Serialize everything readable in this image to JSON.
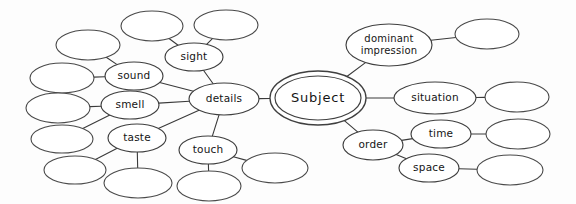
{
  "diagram": {
    "type": "mind-map",
    "background_color": "#fdfdfd",
    "stroke_color": "#3f3f3f",
    "text_color": "#151515",
    "width": 576,
    "height": 204
  },
  "nodes": [
    {
      "id": "subject",
      "label": "Subject",
      "cx": 318,
      "cy": 98,
      "rx": 43,
      "ry": 22,
      "shape": "double-ellipse",
      "style": "root",
      "empty": false
    },
    {
      "id": "details",
      "label": "details",
      "cx": 224,
      "cy": 99,
      "rx": 35,
      "ry": 16,
      "shape": "ellipse",
      "style": "branch",
      "empty": false
    },
    {
      "id": "sight",
      "label": "sight",
      "cx": 194,
      "cy": 57,
      "rx": 29,
      "ry": 14,
      "shape": "ellipse",
      "style": "branch",
      "empty": false
    },
    {
      "id": "sound",
      "label": "sound",
      "cx": 134,
      "cy": 76,
      "rx": 29,
      "ry": 14,
      "shape": "ellipse",
      "style": "branch",
      "empty": false
    },
    {
      "id": "smell",
      "label": "smell",
      "cx": 130,
      "cy": 105,
      "rx": 29,
      "ry": 14,
      "shape": "ellipse",
      "style": "branch",
      "empty": false
    },
    {
      "id": "taste",
      "label": "taste",
      "cx": 137,
      "cy": 138,
      "rx": 29,
      "ry": 14,
      "shape": "ellipse",
      "style": "branch",
      "empty": false
    },
    {
      "id": "touch",
      "label": "touch",
      "cx": 208,
      "cy": 150,
      "rx": 29,
      "ry": 14,
      "shape": "ellipse",
      "style": "branch",
      "empty": false
    },
    {
      "id": "dominant",
      "label": "dominant\nimpression",
      "cx": 389,
      "cy": 45,
      "rx": 43,
      "ry": 21,
      "shape": "ellipse",
      "style": "branch",
      "empty": false
    },
    {
      "id": "situation",
      "label": "situation",
      "cx": 435,
      "cy": 98,
      "rx": 41,
      "ry": 16,
      "shape": "ellipse",
      "style": "branch",
      "empty": false
    },
    {
      "id": "order",
      "label": "order",
      "cx": 373,
      "cy": 145,
      "rx": 30,
      "ry": 15,
      "shape": "ellipse",
      "style": "branch",
      "empty": false
    },
    {
      "id": "time",
      "label": "time",
      "cx": 441,
      "cy": 134,
      "rx": 30,
      "ry": 14,
      "shape": "ellipse",
      "style": "branch",
      "empty": false
    },
    {
      "id": "space",
      "label": "space",
      "cx": 429,
      "cy": 168,
      "rx": 30,
      "ry": 14,
      "shape": "ellipse",
      "style": "branch",
      "empty": false
    },
    {
      "id": "blank-sight-1",
      "label": "",
      "cx": 152,
      "cy": 26,
      "rx": 31,
      "ry": 15,
      "shape": "ellipse",
      "style": "leaf",
      "empty": true
    },
    {
      "id": "blank-sight-2",
      "label": "",
      "cx": 226,
      "cy": 25,
      "rx": 32,
      "ry": 15,
      "shape": "ellipse",
      "style": "leaf",
      "empty": true
    },
    {
      "id": "blank-sound-1",
      "label": "",
      "cx": 88,
      "cy": 45,
      "rx": 32,
      "ry": 15,
      "shape": "ellipse",
      "style": "leaf",
      "empty": true
    },
    {
      "id": "blank-sound-2",
      "label": "",
      "cx": 62,
      "cy": 78,
      "rx": 32,
      "ry": 15,
      "shape": "ellipse",
      "style": "leaf",
      "empty": true
    },
    {
      "id": "blank-smell-1",
      "label": "",
      "cx": 58,
      "cy": 108,
      "rx": 32,
      "ry": 15,
      "shape": "ellipse",
      "style": "leaf",
      "empty": true
    },
    {
      "id": "blank-smell-2",
      "label": "",
      "cx": 62,
      "cy": 139,
      "rx": 31,
      "ry": 14,
      "shape": "ellipse",
      "style": "leaf",
      "empty": true
    },
    {
      "id": "blank-taste-1",
      "label": "",
      "cx": 75,
      "cy": 170,
      "rx": 31,
      "ry": 14,
      "shape": "ellipse",
      "style": "leaf",
      "empty": true
    },
    {
      "id": "blank-taste-2",
      "label": "",
      "cx": 138,
      "cy": 183,
      "rx": 34,
      "ry": 15,
      "shape": "ellipse",
      "style": "leaf",
      "empty": true
    },
    {
      "id": "blank-touch-1",
      "label": "",
      "cx": 209,
      "cy": 186,
      "rx": 32,
      "ry": 15,
      "shape": "ellipse",
      "style": "leaf",
      "empty": true
    },
    {
      "id": "blank-touch-2",
      "label": "",
      "cx": 275,
      "cy": 168,
      "rx": 33,
      "ry": 15,
      "shape": "ellipse",
      "style": "leaf",
      "empty": true
    },
    {
      "id": "blank-dom-1",
      "label": "",
      "cx": 487,
      "cy": 34,
      "rx": 32,
      "ry": 15,
      "shape": "ellipse",
      "style": "leaf",
      "empty": true
    },
    {
      "id": "blank-situ-1",
      "label": "",
      "cx": 517,
      "cy": 97,
      "rx": 32,
      "ry": 15,
      "shape": "ellipse",
      "style": "leaf",
      "empty": true
    },
    {
      "id": "blank-time-1",
      "label": "",
      "cx": 518,
      "cy": 134,
      "rx": 32,
      "ry": 15,
      "shape": "ellipse",
      "style": "leaf",
      "empty": true
    },
    {
      "id": "blank-space-1",
      "label": "",
      "cx": 510,
      "cy": 170,
      "rx": 33,
      "ry": 15,
      "shape": "ellipse",
      "style": "leaf",
      "empty": true
    }
  ],
  "edges": [
    {
      "from": "subject",
      "to": "details"
    },
    {
      "from": "subject",
      "to": "dominant"
    },
    {
      "from": "subject",
      "to": "situation"
    },
    {
      "from": "subject",
      "to": "order"
    },
    {
      "from": "details",
      "to": "sight"
    },
    {
      "from": "details",
      "to": "sound"
    },
    {
      "from": "details",
      "to": "smell"
    },
    {
      "from": "details",
      "to": "taste"
    },
    {
      "from": "details",
      "to": "touch"
    },
    {
      "from": "sight",
      "to": "blank-sight-1"
    },
    {
      "from": "sight",
      "to": "blank-sight-2"
    },
    {
      "from": "sound",
      "to": "blank-sound-1"
    },
    {
      "from": "sound",
      "to": "blank-sound-2"
    },
    {
      "from": "smell",
      "to": "blank-smell-1"
    },
    {
      "from": "smell",
      "to": "blank-smell-2"
    },
    {
      "from": "taste",
      "to": "blank-taste-1"
    },
    {
      "from": "taste",
      "to": "blank-taste-2"
    },
    {
      "from": "touch",
      "to": "blank-touch-1"
    },
    {
      "from": "touch",
      "to": "blank-touch-2"
    },
    {
      "from": "dominant",
      "to": "blank-dom-1"
    },
    {
      "from": "situation",
      "to": "blank-situ-1"
    },
    {
      "from": "order",
      "to": "time"
    },
    {
      "from": "order",
      "to": "space"
    },
    {
      "from": "time",
      "to": "blank-time-1"
    },
    {
      "from": "space",
      "to": "blank-space-1"
    }
  ]
}
